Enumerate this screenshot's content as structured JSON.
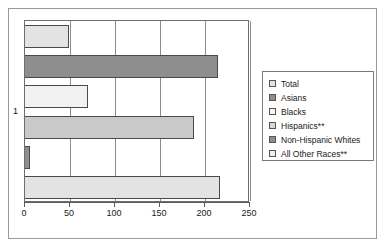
{
  "chart_data": {
    "type": "bar",
    "orientation": "horizontal",
    "title": "",
    "xlabel": "",
    "ylabel": "",
    "categories": [
      "1"
    ],
    "xlim": [
      0,
      250
    ],
    "xticks": [
      0,
      50,
      100,
      150,
      200,
      250
    ],
    "grid": true,
    "legend_position": "right",
    "series": [
      {
        "name": "Total",
        "values": [
          49
        ],
        "color": "#e3e3e3"
      },
      {
        "name": "Asians",
        "values": [
          214
        ],
        "color": "#8e8e8e"
      },
      {
        "name": "Blacks",
        "values": [
          70
        ],
        "color": "#f2f2f2"
      },
      {
        "name": "Hispanics**",
        "values": [
          188
        ],
        "color": "#c9c9c9"
      },
      {
        "name": "Non-Hispanic Whites",
        "values": [
          6
        ],
        "color": "#8e8e8e"
      },
      {
        "name": "All Other Races**",
        "values": [
          217
        ],
        "color": "#e3e3e3"
      }
    ]
  },
  "axis": {
    "y_category_label": "1",
    "x_tick_labels": [
      "0",
      "50",
      "100",
      "150",
      "200",
      "250"
    ]
  },
  "legend": {
    "items": [
      {
        "label": "Total",
        "swatch": "#e3e3e3"
      },
      {
        "label": "Asians",
        "swatch": "#8e8e8e"
      },
      {
        "label": "Blacks",
        "swatch": "#f7f7f7"
      },
      {
        "label": "Hispanics**",
        "swatch": "#d8d8d8"
      },
      {
        "label": "Non-Hispanic Whites",
        "swatch": "#8e8e8e"
      },
      {
        "label": "All Other Races**",
        "swatch": "#efefef"
      }
    ]
  },
  "colors": {
    "frame": "#9a9a9a",
    "plot_border": "#6e6e6e",
    "gridline": "#8c8c8c",
    "bar_outline": "#4a4a4a",
    "text": "#1a1a1a"
  }
}
